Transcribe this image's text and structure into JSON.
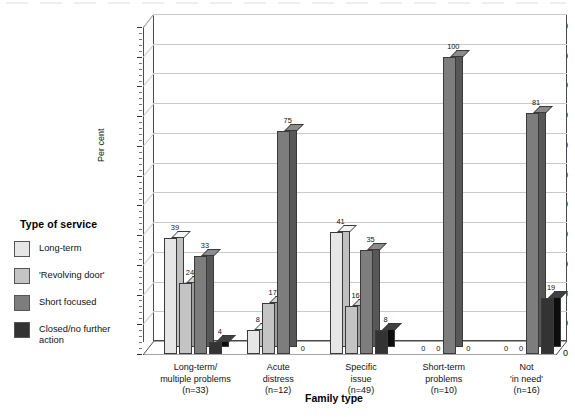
{
  "legend": {
    "title": "Type of service",
    "items": [
      {
        "label": "Long-term",
        "color": "#e6e6e6"
      },
      {
        "label": "'Revolving door'",
        "color": "#c4c4c4"
      },
      {
        "label": "Short focused",
        "color": "#7d7d7d"
      },
      {
        "label": "Closed/no further\naction",
        "color": "#333333"
      }
    ]
  },
  "chart_data": {
    "type": "bar",
    "title": "",
    "xlabel": "Family type",
    "ylabel": "Per cent",
    "ylim": [
      0,
      110
    ],
    "ytick_step": 10,
    "yticks": [
      0,
      10,
      20,
      30,
      40,
      50,
      60,
      70,
      80,
      90,
      100,
      110
    ],
    "grid": true,
    "legend_position": "left",
    "categories": [
      "Long-term/\nmultiple problems\n(n=33)",
      "Acute\ndistress\n(n=12)",
      "Specific\nissue\n(n=49)",
      "Short-term\nproblems\n(n=10)",
      "Not\n'in need'\n(n=16)"
    ],
    "category_lines": [
      [
        "Long-term/",
        "multiple problems",
        "(n=33)"
      ],
      [
        "Acute",
        "distress",
        "(n=12)"
      ],
      [
        "Specific",
        "issue",
        "(n=49)"
      ],
      [
        "Short-term",
        "problems",
        "(n=10)"
      ],
      [
        "Not",
        "'in need'",
        "(n=16)"
      ]
    ],
    "series": [
      {
        "name": "Long-term",
        "color": "#e6e6e6",
        "values": [
          39,
          8,
          41,
          0,
          0
        ]
      },
      {
        "name": "'Revolving door'",
        "color": "#c4c4c4",
        "values": [
          24,
          17,
          16,
          0,
          0
        ]
      },
      {
        "name": "Short focused",
        "color": "#7d7d7d",
        "values": [
          33,
          75,
          35,
          100,
          81
        ]
      },
      {
        "name": "Closed/no further action",
        "color": "#333333",
        "values": [
          4,
          0,
          8,
          0,
          19
        ]
      }
    ]
  },
  "axis": {
    "y_title": "Per cent",
    "x_title": "Family type"
  }
}
